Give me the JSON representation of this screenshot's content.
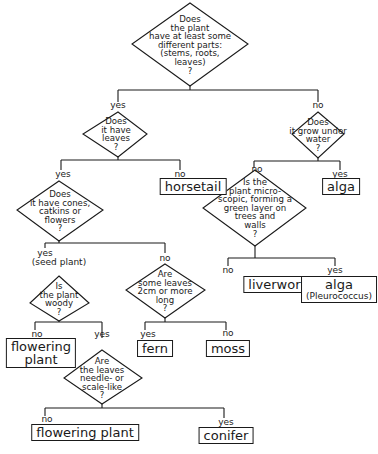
{
  "diagram": {
    "questions": {
      "q1": "Does\nthe plant\nhave at least some\ndifferent parts:\n(stems, roots,\nleaves)\n?",
      "q2": "Does\nit have\nleaves\n?",
      "q3": "Does\nit grow under\nwater\n?",
      "q4": "Does\nit have cones,\ncatkins or\nflowers\n?",
      "q5": "Is the\nplant micro-\nscopic, forming a\ngreen layer on\ntrees and\nwalls\n?",
      "q6": "Is\nthe plant\nwoody\n?",
      "q7": "Are\nsome leaves\n2cm or more\nlong\n?",
      "q8": "Are\nthe leaves\nneedle- or\nscale-like\n?"
    },
    "branch_labels": {
      "q1_yes": "yes",
      "q1_no": "no",
      "q2_yes": "yes",
      "q2_no": "no",
      "q3_no": "no",
      "q3_yes": "yes",
      "q4_yes": "yes",
      "q4_yes_note": "(seed plant)",
      "q4_no": "no",
      "q5_no": "no",
      "q5_yes": "yes",
      "q6_no": "no",
      "q6_yes": "yes",
      "q7_yes": "yes",
      "q7_no": "no",
      "q8_no": "no",
      "q8_yes": "yes"
    },
    "results": {
      "horsetail": "horsetail",
      "alga_water": "alga",
      "liverwort": "liverwort",
      "alga_pleurococcus": "alga",
      "alga_pleurococcus_note": "(Pleurococcus)",
      "flowering_plant_1": "flowering\nplant",
      "fern": "fern",
      "moss": "moss",
      "flowering_plant_2": "flowering plant",
      "conifer": "conifer"
    }
  }
}
